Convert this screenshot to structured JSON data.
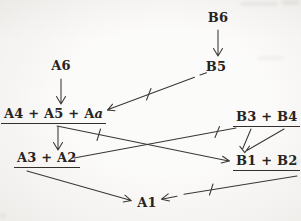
{
  "figure": {
    "type": "stemma-diagram",
    "nodes": {
      "b6": {
        "label": "B6",
        "underlined": false
      },
      "b5": {
        "label": "B5",
        "underlined": false
      },
      "a6": {
        "label": "A6",
        "underlined": false
      },
      "a4a5aa": {
        "label_main": "A4 + A5 + A",
        "label_italic": "a",
        "underlined": true
      },
      "b3b4": {
        "label": "B3 + B4",
        "underlined": true
      },
      "a3a2": {
        "label": "A3 + A2",
        "underlined": true
      },
      "b1b2": {
        "label": "B1 + B2",
        "underlined": true
      },
      "a1": {
        "label": "A1",
        "underlined": false
      }
    },
    "edges": [
      {
        "from": "B6",
        "to": "B5",
        "arrowhead": true,
        "tick_mark": false
      },
      {
        "from": "A6",
        "to": "A4 + A5 + Aa",
        "arrowhead": true,
        "tick_mark": false
      },
      {
        "from": "B5",
        "to": "A4 + A5 + Aa",
        "arrowhead": true,
        "tick_mark": true
      },
      {
        "from": "A4 + A5 + Aa",
        "to": "A3 + A2",
        "arrowhead": true,
        "tick_mark": false
      },
      {
        "from": "A4 + A5 + Aa",
        "to": "B1 + B2",
        "arrowhead": true,
        "tick_mark": true
      },
      {
        "from": "B3 + B4",
        "to": "A3 + A2",
        "arrowhead": false,
        "tick_mark": true
      },
      {
        "from": "B3 + B4",
        "to": "B1 + B2",
        "arrowhead": true,
        "tick_mark": false
      },
      {
        "from": "A3 + A2",
        "to": "A1",
        "arrowhead": true,
        "tick_mark": false
      },
      {
        "from": "B1 + B2",
        "to": "A1",
        "arrowhead": true,
        "tick_mark": true
      }
    ],
    "colors": {
      "paper": "#f7f6f4",
      "ink": "#33302b"
    }
  }
}
